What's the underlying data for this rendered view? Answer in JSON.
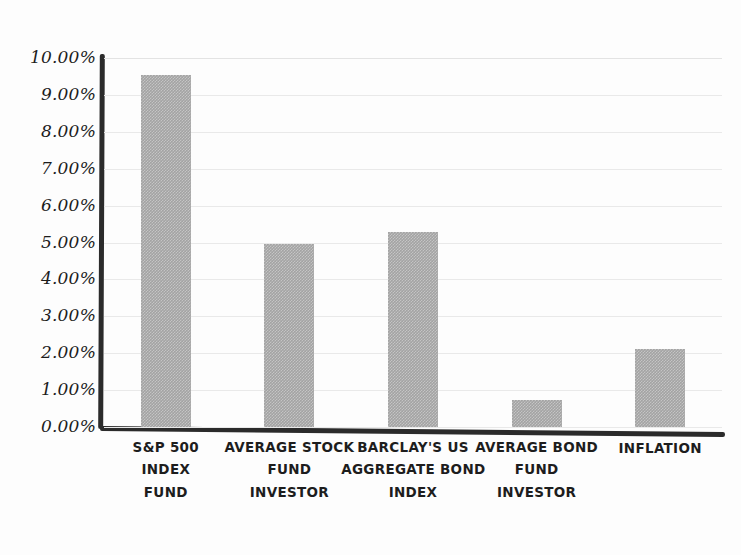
{
  "chart_data": {
    "type": "bar",
    "title": "",
    "subtitle": "",
    "xlabel": "",
    "ylabel": "",
    "ylim": [
      0,
      10
    ],
    "ytick_labels": [
      "10.00%",
      "9.00%",
      "8.00%",
      "7.00%",
      "6.00%",
      "5.00%",
      "4.00%",
      "3.00%",
      "2.00%",
      "1.00%",
      "0.00%"
    ],
    "ytick_values": [
      10,
      9,
      8,
      7,
      6,
      5,
      4,
      3,
      2,
      1,
      0
    ],
    "grid": true,
    "legend": "none",
    "value_suffix": "%",
    "categories": [
      "S&P 500 INDEX FUND",
      "AVERAGE STOCK FUND INVESTOR",
      "BARCLAY'S US AGGREGATE BOND INDEX",
      "AVERAGE BOND FUND INVESTOR",
      "INFLATION"
    ],
    "category_lines": [
      [
        "S&P 500",
        "INDEX",
        "FUND"
      ],
      [
        "AVERAGE STOCK",
        "FUND",
        "INVESTOR"
      ],
      [
        "BARCLAY'S US",
        "AGGREGATE BOND",
        "INDEX"
      ],
      [
        "AVERAGE BOND",
        "FUND",
        "INVESTOR"
      ],
      [
        "INFLATION"
      ]
    ],
    "values": [
      9.53,
      4.97,
      5.29,
      0.72,
      2.11
    ],
    "bar_color": "#a3a3a3",
    "axis_color": "#2b2b2b",
    "gridline_color": "#e9e9e9"
  }
}
